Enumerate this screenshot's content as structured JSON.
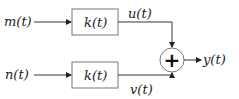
{
  "diagram": {
    "inputs": [
      {
        "label": "m(t)"
      },
      {
        "label": "n(t)"
      }
    ],
    "blocks": [
      {
        "label": "k(t)"
      },
      {
        "label": "k(t)"
      }
    ],
    "intermediate": [
      {
        "label": "u(t)"
      },
      {
        "label": "v(t)"
      }
    ],
    "summer": {
      "symbol": "+"
    },
    "output": {
      "label": "y(t)"
    },
    "colors": {
      "line": "#333333",
      "box_border": "#777777",
      "text": "#222222"
    }
  }
}
